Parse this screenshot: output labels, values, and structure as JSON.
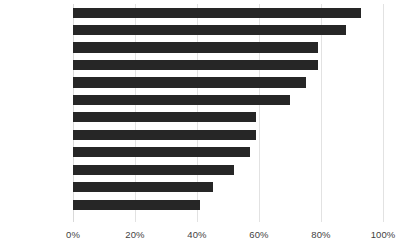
{
  "chart_data": {
    "type": "bar",
    "orientation": "horizontal",
    "title": "",
    "subtitle": "",
    "xlabel": "",
    "ylabel": "",
    "xlim": [
      0,
      100
    ],
    "xticks": [
      0,
      20,
      40,
      60,
      80,
      100
    ],
    "xtick_labels": [
      "0%",
      "20%",
      "40%",
      "60%",
      "80%",
      "100%"
    ],
    "grid": "vertical",
    "legend": "none",
    "bar_color": "#262626",
    "gridline_color": "#e2e2e2",
    "label_color": "#3f3f3f",
    "categories": [
      "S. Africa",
      "Poland",
      "China",
      "Australia",
      "Kazakhstan",
      "India",
      "Czech Rep",
      "Israel",
      "Greece",
      "Morocco",
      "US",
      "Germany"
    ],
    "values": [
      93,
      88,
      79,
      79,
      75,
      70,
      59,
      59,
      57,
      52,
      45,
      41
    ],
    "series": [
      {
        "name": "",
        "values": [
          93,
          88,
          79,
          79,
          75,
          70,
          59,
          59,
          57,
          52,
          45,
          41
        ]
      }
    ],
    "value_unit": "%"
  }
}
